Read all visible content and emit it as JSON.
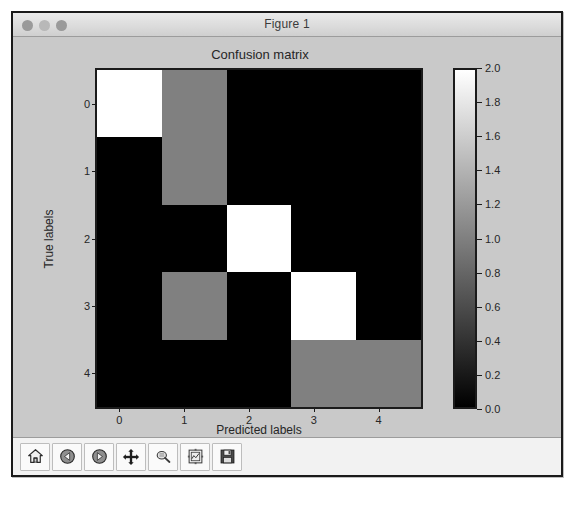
{
  "window": {
    "title": "Figure 1",
    "traffic_lights": [
      "close-button",
      "minimize-button",
      "zoom-button"
    ]
  },
  "chart_data": {
    "type": "heatmap",
    "title": "Confusion matrix",
    "xlabel": "Predicted labels",
    "ylabel": "True labels",
    "xticklabels": [
      "0",
      "1",
      "2",
      "3",
      "4"
    ],
    "yticklabels": [
      "0",
      "1",
      "2",
      "3",
      "4"
    ],
    "categories": [
      "0",
      "1",
      "2",
      "3",
      "4"
    ],
    "grid": false,
    "legend": "colorbar-right",
    "colormap": "gray",
    "vmin": 0.0,
    "vmax": 2.0,
    "values": [
      [
        2,
        1,
        0,
        0,
        0
      ],
      [
        0,
        1,
        0,
        0,
        0
      ],
      [
        0,
        0,
        2,
        0,
        0
      ],
      [
        0,
        1,
        0,
        2,
        0
      ],
      [
        0,
        0,
        0,
        1,
        1
      ]
    ],
    "colorbar": {
      "ticks": [
        "2.0",
        "1.8",
        "1.6",
        "1.4",
        "1.2",
        "1.0",
        "0.8",
        "0.6",
        "0.4",
        "0.2",
        "0.0"
      ],
      "min_label": "0.0",
      "max_label": "2.0"
    }
  },
  "toolbar": {
    "buttons": [
      {
        "name": "home-icon",
        "label": "Home"
      },
      {
        "name": "back-arrow-icon",
        "label": "Back"
      },
      {
        "name": "forward-arrow-icon",
        "label": "Forward"
      },
      {
        "name": "pan-move-icon",
        "label": "Pan"
      },
      {
        "name": "zoom-magnifier-icon",
        "label": "Zoom to rectangle"
      },
      {
        "name": "configure-subplots-icon",
        "label": "Configure subplots"
      },
      {
        "name": "save-floppy-icon",
        "label": "Save figure"
      }
    ]
  },
  "colors": {
    "figure_background": "#c9c9c9",
    "axes_edge": "#1b1b1b",
    "value_0": "#000000",
    "value_1": "#8a8a8a",
    "value_2": "#ffffff",
    "text": "#262626"
  }
}
